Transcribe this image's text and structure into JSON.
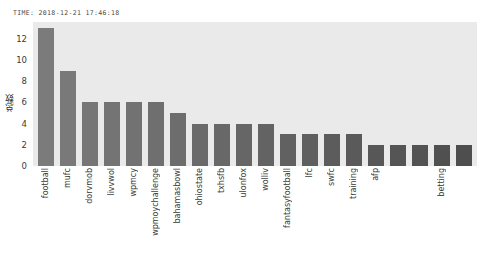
{
  "title": "TIME: 2018-12-21 17:46:18",
  "colors": {
    "bar": "#7b7b7b",
    "plot_background": "#eaeaea",
    "figure_background": "#ffffff",
    "tick_text": "#3a3a3a"
  },
  "chart_data": {
    "type": "bar",
    "title": "TIME: 2018-12-21 17:46:18",
    "xlabel": "",
    "ylabel": "总数",
    "ylim": [
      0,
      13.6
    ],
    "yticks": [
      0,
      2,
      4,
      6,
      8,
      10,
      12
    ],
    "grid": false,
    "legend": null,
    "categories": [
      "football",
      "mufc",
      "dorvmob",
      "livvwol",
      "wpmcy",
      "wpmoychallenge",
      "bahamasbowl",
      "ohiostate",
      "txhsfb",
      "ulonfox",
      "wolliv",
      "fantasyfootball",
      "lfc",
      "swfc",
      "training",
      "afp",
      "",
      "",
      "betting",
      ""
    ],
    "values": [
      13,
      9,
      6,
      6,
      6,
      6,
      5,
      4,
      4,
      4,
      4,
      3,
      3,
      3,
      3,
      2,
      2,
      2,
      2,
      2
    ]
  }
}
